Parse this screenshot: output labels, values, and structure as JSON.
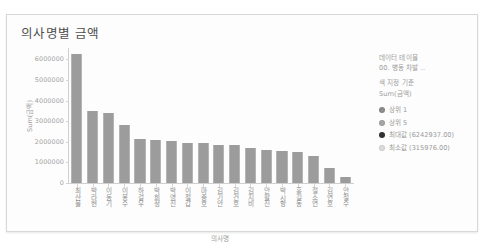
{
  "chart_data": {
    "type": "bar",
    "title": "의사명별 금액",
    "xlabel": "의사명",
    "ylabel": "Sum(금액)",
    "ylim": [
      0,
      6500000
    ],
    "grid": false,
    "legend_position": "right",
    "ytick_labels": [
      "0",
      "1000000",
      "2000000",
      "3000000",
      "4000000",
      "5000000",
      "6000000"
    ],
    "ytick_values": [
      0,
      1000000,
      2000000,
      3000000,
      4000000,
      5000000,
      6000000
    ],
    "categories": [
      "최산물",
      "박라현",
      "이동기",
      "이몽수",
      "하걸우",
      "박희정",
      "박영진",
      "이철갑",
      "마중호",
      "김기안",
      "김건호",
      "김지비",
      "안팔진",
      "박시항",
      "홍길동",
      "절소연",
      "김연호",
      "안철수"
    ],
    "values": [
      6242937,
      3472000,
      3420000,
      2810000,
      2140000,
      2095000,
      2035000,
      1955000,
      1920000,
      1830000,
      1825000,
      1700000,
      1590000,
      1530000,
      1495000,
      1330000,
      720000,
      315976
    ],
    "bar_color": "#9c9c9c",
    "max_value": 6242937,
    "min_value": 315976
  },
  "legend": {
    "header_line1": "데이터 테이블",
    "header_line2": "00. 병동 차발 ..",
    "header_line3": "색 지정 기준",
    "header_line4": "Sum(금액)",
    "items": [
      {
        "label": "상위 1",
        "color": "#8d8d8d"
      },
      {
        "label": "상위 5",
        "color": "#a6a6a6"
      },
      {
        "label": "최대값 (6242937.00)",
        "color": "#333333"
      },
      {
        "label": "최소값 (315976.00)",
        "color": "#dcdcdc"
      }
    ]
  }
}
